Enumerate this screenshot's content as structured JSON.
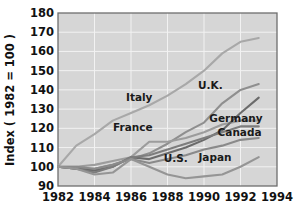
{
  "chart_data": {
    "type": "line",
    "title": "",
    "xlabel": "",
    "ylabel": "Index ( 1982 = 100 )",
    "xlim": [
      1982,
      1994
    ],
    "ylim": [
      90,
      180
    ],
    "xticks": [
      "1982",
      "1984",
      "1986",
      "1988",
      "1990",
      "1992",
      "1994"
    ],
    "yticks": [
      "90",
      "100",
      "110",
      "120",
      "130",
      "140",
      "150",
      "160",
      "170",
      "180"
    ],
    "grid": true,
    "legend_position": "inline-labels",
    "x": [
      1982,
      1983,
      1984,
      1985,
      1986,
      1987,
      1988,
      1989,
      1990,
      1991,
      1992,
      1993
    ],
    "series": [
      {
        "name": "Italy",
        "label": "Italy",
        "color": "#a8a8a8",
        "values": [
          100,
          111,
          117,
          124,
          128,
          132,
          137,
          143,
          150,
          159,
          165,
          167
        ]
      },
      {
        "name": "U.K.",
        "label": "U.K.",
        "color": "#8f8f8f",
        "values": [
          100,
          99,
          99,
          101,
          104,
          107,
          112,
          118,
          123,
          133,
          140,
          143
        ]
      },
      {
        "name": "France",
        "label": "France",
        "color": "#9c9c9c",
        "values": [
          100,
          100,
          101,
          103,
          105,
          113,
          113,
          115,
          118,
          122,
          124,
          124
        ]
      },
      {
        "name": "Germany",
        "label": "Germany",
        "color": "#6b6b6b",
        "values": [
          100,
          99,
          98,
          100,
          105,
          104,
          107,
          110,
          114,
          119,
          128,
          136
        ]
      },
      {
        "name": "Canada",
        "label": "Canada",
        "color": "#7d7d7d",
        "values": [
          100,
          99,
          97,
          100,
          105,
          106,
          109,
          112,
          115,
          118,
          121,
          121
        ]
      },
      {
        "name": "U.S.",
        "label": "U.S.",
        "color": "#8a8a8a",
        "values": [
          100,
          100,
          99,
          101,
          104,
          102,
          104,
          106,
          109,
          111,
          114,
          115
        ]
      },
      {
        "name": "Japan",
        "label": "Japan",
        "color": "#959595",
        "values": [
          100,
          99,
          96,
          97,
          104,
          100,
          96,
          94,
          95,
          96,
          100,
          105
        ]
      }
    ],
    "annotations": [
      {
        "text": "Italy",
        "x": 1986.45,
        "y": 136.0
      },
      {
        "text": "U.K.",
        "x": 1990.35,
        "y": 142.5
      },
      {
        "text": "France",
        "x": 1986.1,
        "y": 120.5
      },
      {
        "text": "Germany",
        "x": 1991.75,
        "y": 125.0
      },
      {
        "text": "Canada",
        "x": 1991.95,
        "y": 118.0
      },
      {
        "text": "U.S.",
        "x": 1988.45,
        "y": 104.5
      },
      {
        "text": "Japan",
        "x": 1990.6,
        "y": 105.0
      }
    ]
  }
}
